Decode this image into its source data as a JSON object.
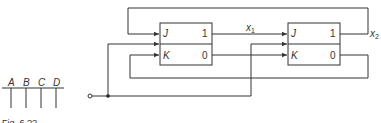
{
  "diagram": {
    "type": "sequential-logic-circuit",
    "flipflops": [
      {
        "id": "ff1",
        "inputs": {
          "j": "J",
          "k": "K"
        },
        "outputs": {
          "q": "1",
          "qbar": "0"
        },
        "output_label": "x1"
      },
      {
        "id": "ff2",
        "inputs": {
          "j": "J",
          "k": "K"
        },
        "outputs": {
          "q": "1",
          "qbar": "0"
        },
        "output_label": "x2"
      }
    ],
    "labels": {
      "x1_var": "x",
      "x1_sub": "1",
      "x2_var": "x",
      "x2_sub": "2"
    },
    "bus_labels": [
      "A",
      "B",
      "C",
      "D"
    ],
    "caption": "Fig. 6.??",
    "colors": {
      "line": "#333333",
      "background": "#ffffff"
    }
  }
}
